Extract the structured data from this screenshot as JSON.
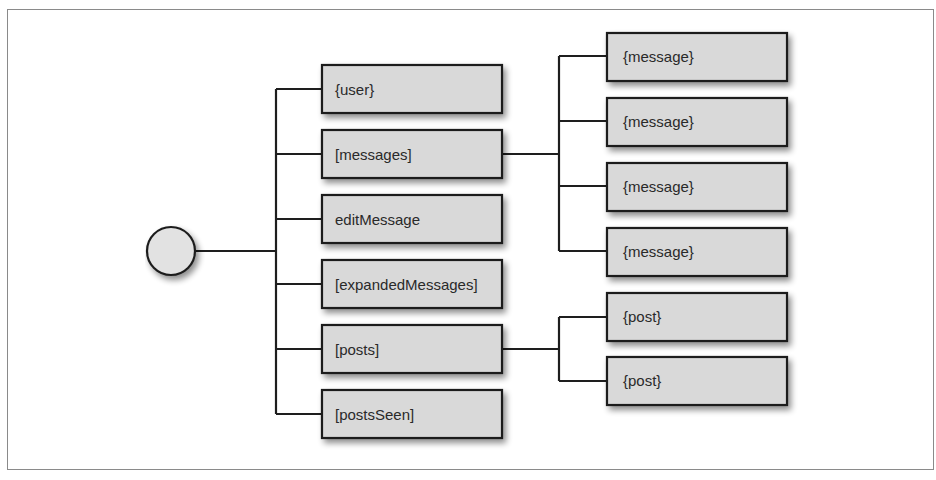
{
  "diagram": {
    "type": "tree",
    "root": {
      "label": "",
      "shape": "circle"
    },
    "children": [
      {
        "label": "{user}"
      },
      {
        "label": "[messages]",
        "children": [
          {
            "label": "{message}"
          },
          {
            "label": "{message}"
          },
          {
            "label": "{message}"
          },
          {
            "label": "{message}"
          }
        ]
      },
      {
        "label": "editMessage"
      },
      {
        "label": "[expandedMessages]"
      },
      {
        "label": "[posts]",
        "children": [
          {
            "label": "{post}"
          },
          {
            "label": "{post}"
          }
        ]
      },
      {
        "label": "[postsSeen]"
      }
    ],
    "colors": {
      "node_fill": "#d9d9d9",
      "node_stroke": "#1e1e1e",
      "line": "#1e1e1e",
      "frame": "#8a8a8a"
    }
  }
}
